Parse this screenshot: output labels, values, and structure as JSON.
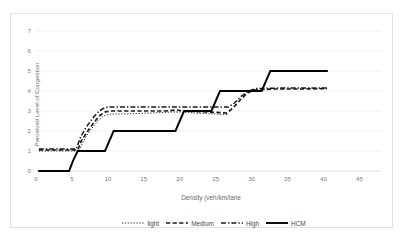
{
  "chart_data": {
    "type": "line",
    "title": "",
    "xlabel": "Density (veh/km/lane",
    "ylabel": "Perceived Level of Congestion",
    "xlim": [
      0,
      48
    ],
    "ylim": [
      0,
      7.4
    ],
    "xticks": [
      0,
      5,
      10,
      15,
      20,
      25,
      30,
      35,
      40,
      45
    ],
    "yticks": [
      0,
      1,
      2,
      3,
      4,
      5,
      6,
      7
    ],
    "grid": "horizontal",
    "legend_position": "bottom",
    "series": [
      {
        "name": "light",
        "style": "dotted",
        "color": "#3f3f3f",
        "points": [
          [
            0.4,
            1.0
          ],
          [
            6.0,
            1.0
          ],
          [
            6.4,
            1.35
          ],
          [
            7.0,
            1.75
          ],
          [
            7.8,
            2.15
          ],
          [
            8.6,
            2.5
          ],
          [
            9.4,
            2.75
          ],
          [
            10.2,
            2.85
          ],
          [
            12.0,
            2.85
          ],
          [
            16.0,
            2.9
          ],
          [
            19.0,
            2.95
          ],
          [
            20.0,
            2.95
          ],
          [
            22.0,
            2.9
          ],
          [
            25.0,
            2.85
          ],
          [
            26.8,
            2.82
          ]
        ]
      },
      {
        "name": "Medium",
        "style": "dashed",
        "color": "#1a1a1a",
        "points": [
          [
            0.4,
            1.05
          ],
          [
            5.8,
            1.05
          ],
          [
            6.3,
            1.5
          ],
          [
            7.2,
            2.0
          ],
          [
            8.0,
            2.4
          ],
          [
            8.8,
            2.75
          ],
          [
            9.6,
            2.95
          ],
          [
            10.4,
            3.0
          ],
          [
            14.0,
            3.0
          ],
          [
            18.0,
            3.0
          ],
          [
            19.6,
            3.05
          ],
          [
            20.4,
            3.0
          ],
          [
            24.0,
            2.95
          ],
          [
            26.6,
            2.9
          ],
          [
            27.4,
            3.15
          ],
          [
            28.4,
            3.55
          ],
          [
            29.4,
            3.9
          ],
          [
            30.4,
            4.05
          ],
          [
            33.0,
            4.1
          ],
          [
            37.0,
            4.1
          ],
          [
            40.5,
            4.12
          ]
        ]
      },
      {
        "name": "High",
        "style": "dashdot",
        "color": "#1a1a1a",
        "points": [
          [
            0.4,
            1.1
          ],
          [
            5.6,
            1.1
          ],
          [
            6.2,
            1.7
          ],
          [
            7.0,
            2.2
          ],
          [
            7.9,
            2.65
          ],
          [
            8.8,
            3.0
          ],
          [
            9.6,
            3.18
          ],
          [
            10.4,
            3.2
          ],
          [
            15.0,
            3.2
          ],
          [
            20.0,
            3.2
          ],
          [
            25.0,
            3.2
          ],
          [
            26.8,
            3.2
          ],
          [
            27.6,
            3.4
          ],
          [
            28.6,
            3.75
          ],
          [
            29.6,
            4.0
          ],
          [
            30.6,
            4.12
          ],
          [
            34.0,
            4.15
          ],
          [
            38.0,
            4.15
          ],
          [
            40.5,
            4.15
          ]
        ]
      },
      {
        "name": "HCM",
        "style": "solid",
        "color": "#000000",
        "points": [
          [
            0.3,
            0.0
          ],
          [
            4.6,
            0.0
          ],
          [
            5.2,
            0.55
          ],
          [
            5.8,
            1.0
          ],
          [
            9.6,
            1.0
          ],
          [
            10.2,
            1.5
          ],
          [
            10.8,
            2.0
          ],
          [
            19.4,
            2.0
          ],
          [
            20.0,
            2.5
          ],
          [
            20.6,
            3.0
          ],
          [
            24.4,
            3.0
          ],
          [
            25.0,
            3.5
          ],
          [
            25.6,
            4.0
          ],
          [
            31.4,
            4.0
          ],
          [
            32.0,
            4.5
          ],
          [
            32.6,
            5.0
          ],
          [
            40.6,
            5.0
          ]
        ]
      }
    ]
  },
  "legend": {
    "items": [
      {
        "label": "light"
      },
      {
        "label": "Medium"
      },
      {
        "label": "High"
      },
      {
        "label": "HCM"
      }
    ]
  },
  "axes": {
    "x_title": "Density (veh/km/lane",
    "y_title": "Perceived Level of Congestion",
    "x_tick_labels": [
      "0",
      "5",
      "10",
      "15",
      "20",
      "25",
      "30",
      "35",
      "40",
      "45"
    ],
    "y_tick_labels": [
      "0",
      "1",
      "2",
      "3",
      "4",
      "5",
      "6",
      "7"
    ]
  },
  "colors": {
    "grid": "#e8e8e8",
    "axis": "#d9d9d9",
    "text": "#808080",
    "line": "#1a1a1a",
    "frame": "#e2e2e2"
  }
}
